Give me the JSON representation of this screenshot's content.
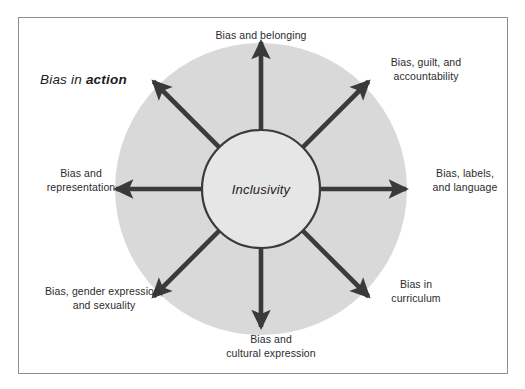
{
  "diagram": {
    "title": {
      "prefix": "Bias in ",
      "emphasis": "action"
    },
    "center": {
      "label": "Inclusivity"
    },
    "colors": {
      "disc_fill": "#d9d9d9",
      "stroke": "#3a3a3a",
      "frame_border": "#8e8e8e",
      "text": "#2b2b2b",
      "background": "#ffffff"
    },
    "spokes": [
      {
        "id": "north",
        "direction": "up",
        "angle_deg": 90,
        "label": "Bias and belonging"
      },
      {
        "id": "northeast",
        "direction": "up-right",
        "angle_deg": 45,
        "label": "Bias, guilt, and\naccountability"
      },
      {
        "id": "east",
        "direction": "right",
        "angle_deg": 0,
        "label": "Bias, labels,\nand language"
      },
      {
        "id": "southeast",
        "direction": "down-right",
        "angle_deg": -45,
        "label": "Bias in\ncurriculum"
      },
      {
        "id": "south",
        "direction": "down",
        "angle_deg": -90,
        "label": "Bias and\ncultural expression"
      },
      {
        "id": "southwest",
        "direction": "down-left",
        "angle_deg": -135,
        "label": "Bias, gender expression,\nand sexuality"
      },
      {
        "id": "west",
        "direction": "left",
        "angle_deg": 180,
        "label": "Bias and\nrepresentation"
      }
    ]
  }
}
